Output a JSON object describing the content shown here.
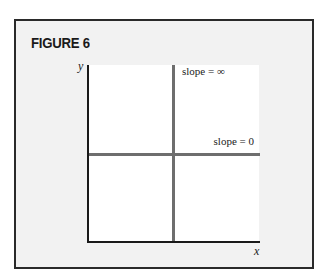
{
  "figure": {
    "title": "FIGURE 6"
  },
  "diagram": {
    "axes": {
      "y_label": "y",
      "x_label": "x"
    },
    "lines": [
      {
        "orientation": "vertical",
        "label": "slope = ∞",
        "color": "#6e6e6e"
      },
      {
        "orientation": "horizontal",
        "label": "slope = 0",
        "color": "#6e6e6e"
      }
    ]
  },
  "colors": {
    "frame_border": "#2a2a2a",
    "frame_background": "#f2f2f2",
    "plot_background": "#ffffff",
    "axis": "#1a1a1a",
    "slope_lines": "#6e6e6e"
  }
}
